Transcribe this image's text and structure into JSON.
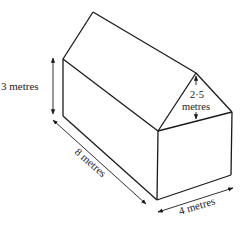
{
  "figure": {
    "labels": {
      "wall_height": "3 metres",
      "length": "8 metres",
      "width": "4 metres",
      "roof_height_line1": "2·5",
      "roof_height_line2": "metres"
    },
    "colors": {
      "stroke": "#1a1a1a",
      "background": "#ffffff",
      "text": "#222222"
    }
  }
}
